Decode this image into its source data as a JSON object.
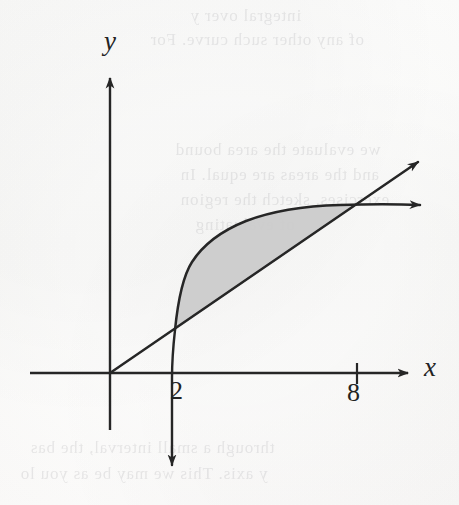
{
  "figure": {
    "kind": "cartesian-plot",
    "paper_color": "#fbfbfa",
    "ink_color": "#262626",
    "shade_color": "#cbcbcb",
    "ghost_text": [
      {
        "text": "integral over y",
        "left": 190,
        "top": 6
      },
      {
        "text": "of any other such curve. For",
        "left": 150,
        "top": 30
      },
      {
        "text": "we evaluate the area bound",
        "left": 175,
        "top": 140
      },
      {
        "text": "and the areas are equal. In",
        "left": 180,
        "top": 165
      },
      {
        "text": "exercises, sketch the region",
        "left": 180,
        "top": 190
      },
      {
        "text": "of evaluating",
        "left": 195,
        "top": 215
      },
      {
        "text": "through a small interval, the bas",
        "left": 30,
        "top": 438
      },
      {
        "text": "y axis. This we may be as you lo",
        "left": 20,
        "top": 464
      }
    ]
  },
  "chart_data": {
    "type": "line",
    "title": "",
    "xlabel": "x",
    "ylabel": "y",
    "xlim": [
      -2.2,
      13.8
    ],
    "ylim": [
      -4.1,
      8.6
    ],
    "grid": false,
    "legend": null,
    "annotations": [
      {
        "text": "shaded region between the curve and the line from x = 2 to x = 8"
      }
    ],
    "xticks": [
      {
        "value": 2,
        "label": "2",
        "has_mark": false
      },
      {
        "value": 8,
        "label": "8",
        "has_mark": true
      }
    ],
    "yticks": [],
    "series": [
      {
        "name": "line",
        "type": "line",
        "description": "straight line through the origin with positive slope, arrowhead at the upper right",
        "points": [
          [
            0,
            0
          ],
          [
            2,
            1.05
          ],
          [
            4,
            2.1
          ],
          [
            6,
            3.15
          ],
          [
            8,
            4.2
          ],
          [
            10,
            5.25
          ],
          [
            11.6,
            6.1
          ]
        ],
        "arrow_end": true
      },
      {
        "name": "curve",
        "type": "curve",
        "description": "logarithm-like curve rising steeply near x = 2 then flattening, vertical asymptote at x = 2 with a downward arrow below the x-axis, arrowhead at the right",
        "points": [
          [
            2.02,
            -3.6
          ],
          [
            2.05,
            -1.2
          ],
          [
            2.1,
            0.35
          ],
          [
            2.2,
            1.2
          ],
          [
            2.5,
            2.1
          ],
          [
            3.0,
            2.85
          ],
          [
            3.8,
            3.5
          ],
          [
            5.0,
            4.0
          ],
          [
            6.4,
            4.25
          ],
          [
            8.0,
            4.2
          ],
          [
            10.0,
            4.2
          ],
          [
            11.9,
            4.2
          ]
        ],
        "arrow_end": true,
        "arrow_down": true
      }
    ],
    "shaded_region": {
      "name": "area-between-curves",
      "fill": "#cbcbcb",
      "x_from": 2,
      "x_to": 8,
      "upper": "curve",
      "lower": "line"
    }
  },
  "labels": {
    "y_axis": "y",
    "x_axis": "x",
    "tick_2": "2",
    "tick_8": "8"
  }
}
